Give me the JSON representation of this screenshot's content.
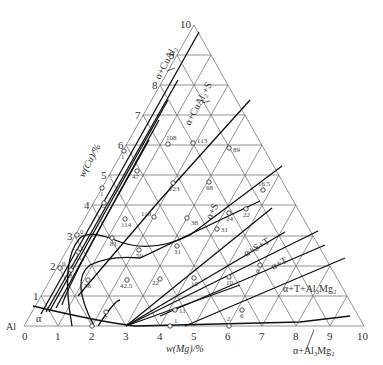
{
  "diagram": {
    "type": "ternary-phase-diagram",
    "corner_label": "Al",
    "axes": {
      "mg": {
        "title": "w(Mg)/%",
        "ticks": [
          "0",
          "1",
          "2",
          "3",
          "4",
          "5",
          "6",
          "7",
          "8",
          "9",
          "10"
        ]
      },
      "cu": {
        "title": "w(Cu)/%",
        "ticks": [
          "1",
          "2",
          "3",
          "4",
          "5",
          "6",
          "7",
          "8",
          "9",
          "10"
        ]
      }
    },
    "phase_labels": [
      {
        "id": "alpha",
        "text": "α"
      },
      {
        "id": "alpha-cual2",
        "text": "α+CuAl₂"
      },
      {
        "id": "alpha-cual2-s",
        "text": "α+CuAl₂+S"
      },
      {
        "id": "alpha-s",
        "text": "α+S"
      },
      {
        "id": "alpha-s-t",
        "text": "α+S+T"
      },
      {
        "id": "alpha-t",
        "text": "α+T"
      },
      {
        "id": "alpha-t-al3mg2",
        "text": "α+T+Al₃Mg₂"
      },
      {
        "id": "alpha-al3mg2",
        "text": "α+Al₃Mg₂"
      }
    ],
    "data_points": [
      {
        "label": "108",
        "x": 168,
        "y": 144
      },
      {
        "label": "113",
        "x": 193,
        "y": 143
      },
      {
        "label": "89",
        "x": 229,
        "y": 148
      },
      {
        "label": "1",
        "x": 124,
        "y": 151
      },
      {
        "label": "47",
        "x": 137,
        "y": 171
      },
      {
        "label": "123",
        "x": 173,
        "y": 183
      },
      {
        "label": "68",
        "x": 209,
        "y": 182
      },
      {
        "label": "16.5",
        "x": 263,
        "y": 190
      },
      {
        "label": "1",
        "x": 102,
        "y": 188
      },
      {
        "label": "7",
        "x": 104,
        "y": 203
      },
      {
        "label": "118",
        "x": 154,
        "y": 217
      },
      {
        "label": "114",
        "x": 125,
        "y": 219
      },
      {
        "label": "38",
        "x": 187,
        "y": 218
      },
      {
        "label": "24",
        "x": 229,
        "y": 213
      },
      {
        "label": "22",
        "x": 246,
        "y": 209
      },
      {
        "label": "31",
        "x": 217,
        "y": 229
      },
      {
        "label": "0",
        "x": 77,
        "y": 235
      },
      {
        "label": "81",
        "x": 112,
        "y": 238
      },
      {
        "label": "59",
        "x": 139,
        "y": 250
      },
      {
        "label": "31",
        "x": 177,
        "y": 246
      },
      {
        "label": "11",
        "x": 78,
        "y": 252
      },
      {
        "label": "0",
        "x": 60,
        "y": 268
      },
      {
        "label": "8",
        "x": 71,
        "y": 270
      },
      {
        "label": "56",
        "x": 88,
        "y": 280
      },
      {
        "label": "42.5",
        "x": 127,
        "y": 280
      },
      {
        "label": "22",
        "x": 160,
        "y": 279
      },
      {
        "label": "10",
        "x": 194,
        "y": 278
      },
      {
        "label": "10",
        "x": 229,
        "y": 277
      },
      {
        "label": "8",
        "x": 260,
        "y": 265
      },
      {
        "label": "7",
        "x": 106,
        "y": 312
      },
      {
        "label": "11",
        "x": 175,
        "y": 310
      },
      {
        "label": "6",
        "x": 242,
        "y": 310
      },
      {
        "label": "0",
        "x": 92,
        "y": 326
      },
      {
        "label": "1",
        "x": 170,
        "y": 326
      },
      {
        "label": "2",
        "x": 229,
        "y": 326
      }
    ]
  }
}
